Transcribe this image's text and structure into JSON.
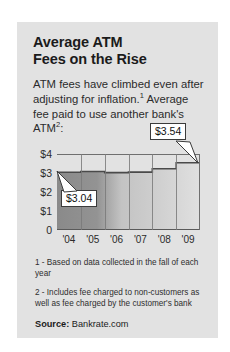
{
  "card": {
    "title_line1": "Average ATM",
    "title_line2": "Fees on the Rise",
    "intro_part1": "ATM fees have climbed even after adjusting for inflation.",
    "intro_sup1": "1",
    "intro_part2": " Average fee paid to use another bank's ATM",
    "intro_sup2": "2",
    "intro_part3": ":",
    "footnote1": "1 - Based on data collected in the fall of each year",
    "footnote2": "2 - Includes fee charged to non-customers as well as fee charged by the customer's bank",
    "source_label": "Source:",
    "source_value": "Bankrate.com"
  },
  "chart_data": {
    "type": "area",
    "title": "Average ATM Fees on the Rise",
    "xlabel": "",
    "ylabel": "",
    "categories": [
      "'04",
      "'05",
      "'06",
      "'07",
      "'08",
      "'09"
    ],
    "values": [
      3.04,
      3.08,
      3.02,
      3.05,
      3.22,
      3.54
    ],
    "ylim": [
      0,
      4
    ],
    "ytick_labels": [
      "$4",
      "$3",
      "$2",
      "$1",
      "0"
    ],
    "ytick_values": [
      4,
      3,
      2,
      1,
      0
    ],
    "grid": true,
    "legend": "none",
    "annotations": [
      {
        "label": "$3.04",
        "x": "'04",
        "value": 3.04
      },
      {
        "label": "$3.54",
        "x": "'09",
        "value": 3.54
      }
    ],
    "colors": {
      "area_left": "#8b8b8b",
      "area_right": "#dcdcdc",
      "line": "#4a4a4a",
      "axis": "#6f6f6f",
      "card_bg": "#e2e2e2",
      "text": "#1b1b1b"
    }
  }
}
